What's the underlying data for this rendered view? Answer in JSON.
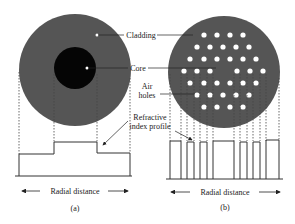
{
  "figure": {
    "colors": {
      "cladding": "#555555",
      "core": "#050505",
      "holes": "#ffffff",
      "lines": "#333333"
    },
    "labels": {
      "cladding": "Cladding",
      "core": "Core",
      "air_holes_1": "Air",
      "air_holes_2": "holes",
      "refractive_1": "Refractive",
      "refractive_2": "index profile"
    },
    "panel_a": {
      "caption": "(a)",
      "axis_label": "Radial distance"
    },
    "panel_b": {
      "caption": "(b)",
      "axis_label": "Radial distance"
    }
  }
}
